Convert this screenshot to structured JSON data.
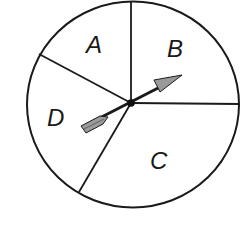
{
  "diagram": {
    "type": "spinner",
    "sections": [
      {
        "id": "A",
        "label": "A",
        "x": 96,
        "y": 53
      },
      {
        "id": "B",
        "label": "B",
        "x": 175,
        "y": 57
      },
      {
        "id": "C",
        "label": "C",
        "x": 160,
        "y": 170
      },
      {
        "id": "D",
        "label": "D",
        "x": 59,
        "y": 125
      }
    ],
    "colors": {
      "stroke": "#1a1a1a",
      "arrow_fill": "#9a9a9a",
      "background": "#ffffff"
    }
  }
}
